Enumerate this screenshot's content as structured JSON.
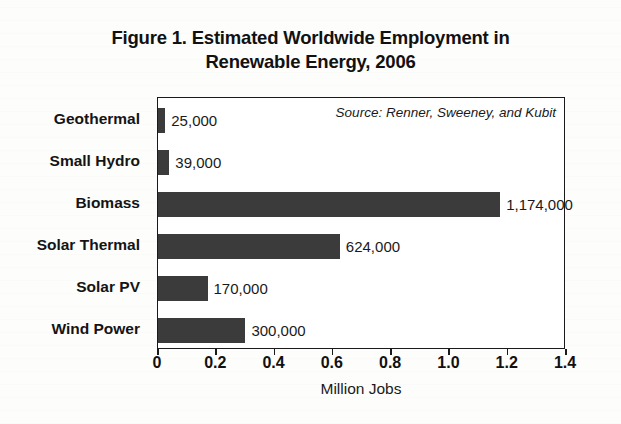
{
  "title": {
    "line1": "Figure 1. Estimated Worldwide Employment in",
    "line2": "Renewable Energy, 2006"
  },
  "source_note": "Source: Renner, Sweeney, and Kubit",
  "axis": {
    "xlabel": "Million Jobs",
    "ticks": [
      "0",
      "0.2",
      "0.4",
      "0.6",
      "0.8",
      "1.0",
      "1.2",
      "1.4"
    ]
  },
  "chart_data": {
    "type": "bar",
    "orientation": "horizontal",
    "title": "Figure 1. Estimated Worldwide Employment in Renewable Energy, 2006",
    "subtitle": "",
    "xlabel": "Million Jobs",
    "ylabel": "",
    "xlim": [
      0,
      1.4
    ],
    "xticks": [
      0,
      0.2,
      0.4,
      0.6,
      0.8,
      1.0,
      1.2,
      1.4
    ],
    "grid": false,
    "legend": false,
    "annotation": "Source: Renner, Sweeney, and Kubit",
    "bar_color": "#3b3b3b",
    "units": "million jobs",
    "categories": [
      "Geothermal",
      "Small Hydro",
      "Biomass",
      "Solar Thermal",
      "Solar PV",
      "Wind Power"
    ],
    "values": [
      0.025,
      0.039,
      1.174,
      0.624,
      0.17,
      0.3
    ],
    "value_labels": [
      "25,000",
      "39,000",
      "1,174,000",
      "624,000",
      "170,000",
      "300,000"
    ]
  }
}
